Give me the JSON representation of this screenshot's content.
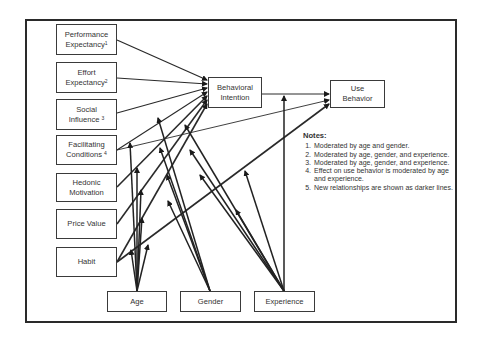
{
  "diagram": {
    "type": "structural model (UTAUT2)",
    "constructs": [
      {
        "id": "pe",
        "label": "Performance Expectancy",
        "sup": "1"
      },
      {
        "id": "ee",
        "label": "Effort Expectancy",
        "sup": "2"
      },
      {
        "id": "si",
        "label": "Social Influence",
        "sup": "3"
      },
      {
        "id": "fc",
        "label": "Facilitating Conditions",
        "sup": "4"
      },
      {
        "id": "hm",
        "label": "Hedonic Motivation",
        "sup": ""
      },
      {
        "id": "pv",
        "label": "Price Value",
        "sup": ""
      },
      {
        "id": "hb",
        "label": "Habit",
        "sup": ""
      }
    ],
    "outcomes": {
      "bi": {
        "line1": "Behavioral",
        "line2": "Intention"
      },
      "ub": {
        "line1": "Use",
        "line2": "Behavior"
      }
    },
    "moderators": [
      {
        "id": "age",
        "label": "Age"
      },
      {
        "id": "gender",
        "label": "Gender"
      },
      {
        "id": "experience",
        "label": "Experience"
      }
    ],
    "notes": {
      "title": "Notes:",
      "items": [
        "Moderated by age and gender.",
        "Moderated by age, gender, and experience.",
        "Moderated by age, gender, and experience.",
        "Effect on use behavior is moderated by age and experience.",
        "New relationships are shown as darker lines."
      ]
    },
    "edges": [
      {
        "from": "pe",
        "to": "bi"
      },
      {
        "from": "ee",
        "to": "bi"
      },
      {
        "from": "si",
        "to": "bi"
      },
      {
        "from": "fc",
        "to": "bi"
      },
      {
        "from": "fc",
        "to": "ub"
      },
      {
        "from": "hm",
        "to": "bi"
      },
      {
        "from": "pv",
        "to": "bi"
      },
      {
        "from": "hb",
        "to": "bi"
      },
      {
        "from": "hb",
        "to": "ub"
      },
      {
        "from": "bi",
        "to": "ub"
      }
    ]
  },
  "labels": {
    "pe1": "Performance",
    "pe2": "Expectancy",
    "pe_sup": "1",
    "ee1": "Effort",
    "ee2": "Expectancy",
    "ee_sup": "2",
    "si1": "Social",
    "si2": "Influence",
    "si_sup": "3",
    "fc1": "Facilitating",
    "fc2": "Conditions",
    "fc_sup": "4",
    "hm1": "Hedonic",
    "hm2": "Motivation",
    "pv": "Price Value",
    "hb": "Habit",
    "bi1": "Behavioral",
    "bi2": "Intention",
    "ub1": "Use",
    "ub2": "Behavior",
    "age": "Age",
    "gender": "Gender",
    "experience": "Experience"
  }
}
